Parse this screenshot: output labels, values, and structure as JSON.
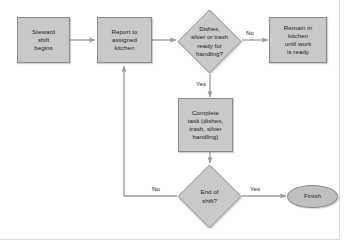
{
  "diagram": {
    "type": "flowchart",
    "style": {
      "node_fill": "#c9c9c9",
      "node_border": "#8a8a8a",
      "connector_color": "#9a9a9a",
      "text_color": "#1b1b1b",
      "background": "#ffffff"
    },
    "nodes": [
      {
        "id": "start",
        "shape": "process",
        "label": "Steward shift begins",
        "lines": [
          "Steward",
          "shift",
          "begins"
        ]
      },
      {
        "id": "report",
        "shape": "process",
        "label": "Report to assigned kitchen",
        "lines": [
          "Report to",
          "assigned",
          "kitchen"
        ]
      },
      {
        "id": "ready",
        "shape": "decision",
        "label": "Dishes, silver or trash ready for handling?",
        "lines": [
          "Dishes,",
          "silver or trash",
          "ready for",
          "handling?"
        ]
      },
      {
        "id": "remain",
        "shape": "process",
        "label": "Remain in kitchen until work is ready",
        "lines": [
          "Remain in",
          "kitchen",
          "until work",
          "is ready"
        ]
      },
      {
        "id": "complete",
        "shape": "process",
        "label": "Complete task (dishes, trash, silver handling)",
        "lines": [
          "Complete",
          "task (dishes,",
          "trash, silver",
          "handling)"
        ]
      },
      {
        "id": "endshift",
        "shape": "decision",
        "label": "End of shift?",
        "lines": [
          "End of",
          "shift?"
        ]
      },
      {
        "id": "finish",
        "shape": "terminal",
        "label": "Finish",
        "lines": [
          "Finish"
        ]
      }
    ],
    "edges": [
      {
        "id": "start-report",
        "from": "start",
        "to": "report",
        "label": ""
      },
      {
        "id": "report-ready",
        "from": "report",
        "to": "ready",
        "label": ""
      },
      {
        "id": "ready-remain",
        "from": "ready",
        "to": "remain",
        "label": "No"
      },
      {
        "id": "ready-complete",
        "from": "ready",
        "to": "complete",
        "label": "Yes"
      },
      {
        "id": "complete-endshift",
        "from": "complete",
        "to": "endshift",
        "label": ""
      },
      {
        "id": "endshift-finish",
        "from": "endshift",
        "to": "finish",
        "label": "Yes"
      },
      {
        "id": "endshift-report",
        "from": "endshift",
        "to": "report",
        "label": "No"
      }
    ]
  }
}
